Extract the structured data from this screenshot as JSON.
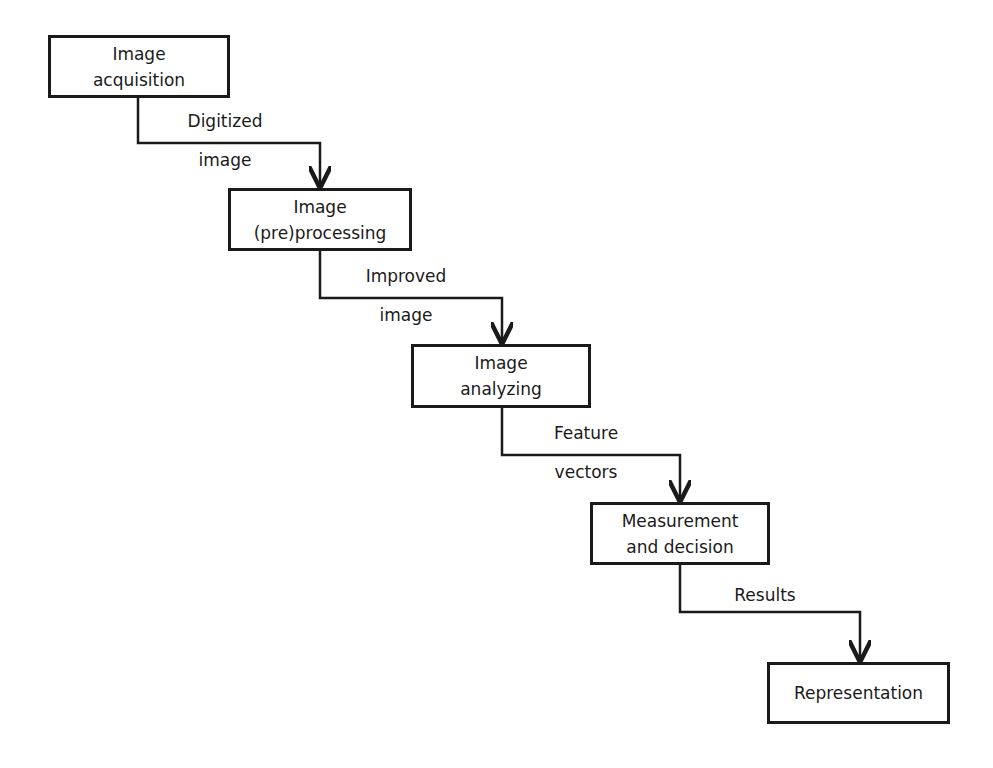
{
  "diagram": {
    "type": "flowchart-staircase",
    "stroke_color": "#1a1a1a",
    "nodes": [
      {
        "id": "n1",
        "lines": [
          "Image",
          "acquisition"
        ]
      },
      {
        "id": "n2",
        "lines": [
          "Image",
          "(pre)processing"
        ]
      },
      {
        "id": "n3",
        "lines": [
          "Image",
          "analyzing"
        ]
      },
      {
        "id": "n4",
        "lines": [
          "Measurement",
          "and decision"
        ]
      },
      {
        "id": "n5",
        "lines": [
          "Representation"
        ]
      }
    ],
    "edges": [
      {
        "from": "n1",
        "to": "n2",
        "label_top": "Digitized",
        "label_bottom": "image"
      },
      {
        "from": "n2",
        "to": "n3",
        "label_top": "Improved",
        "label_bottom": "image"
      },
      {
        "from": "n3",
        "to": "n4",
        "label_top": "Feature",
        "label_bottom": "vectors"
      },
      {
        "from": "n4",
        "to": "n5",
        "label_top": "Results",
        "label_bottom": ""
      }
    ]
  }
}
